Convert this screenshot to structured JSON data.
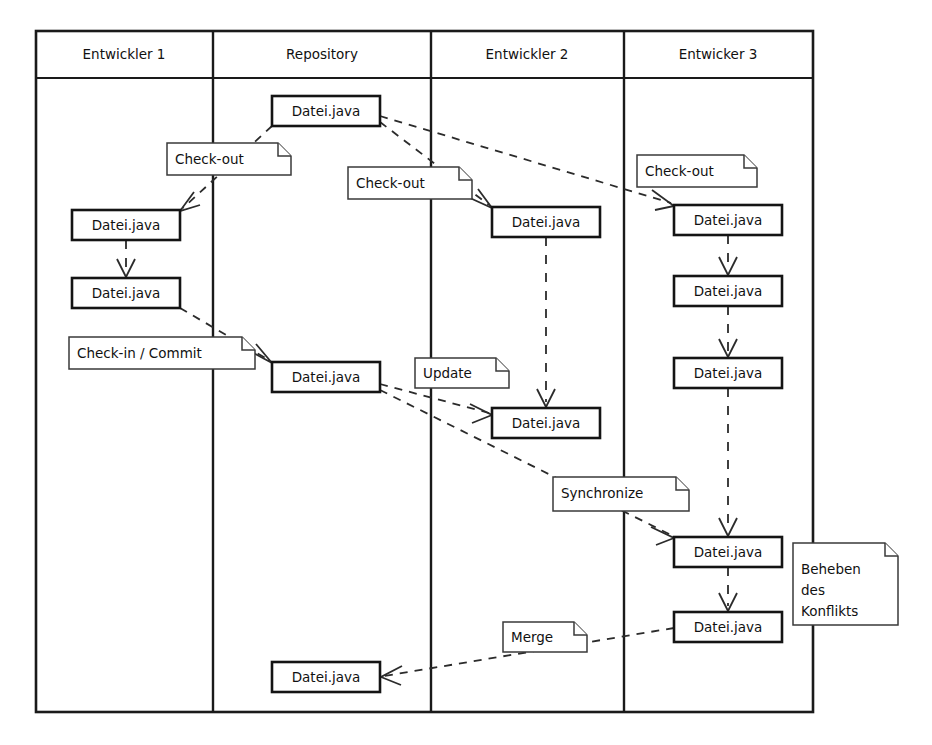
{
  "diagram": {
    "lanes": [
      {
        "id": "entwickler-1",
        "label": "Entwickler 1",
        "x": 36,
        "width": 177
      },
      {
        "id": "repository",
        "label": "Repository",
        "x": 213,
        "width": 218
      },
      {
        "id": "entwickler-2",
        "label": "Entwickler 2",
        "x": 431,
        "width": 193
      },
      {
        "id": "entwickler-3",
        "label": "Entwicker 3",
        "x": 624,
        "width": 189
      }
    ],
    "frame": {
      "x": 36,
      "y": 31,
      "width": 777,
      "height": 681,
      "header_height": 47
    },
    "colors": {
      "line": "#1a1a1a",
      "box_stroke": "#141414",
      "note_stroke": "#3a3a3a",
      "dash_stroke": "#2b2b2b",
      "background": "#ffffff"
    },
    "artifacts": [
      {
        "id": "repo-initial",
        "lane": "repository",
        "label": "Datei.java",
        "x": 272,
        "y": 96,
        "width": 108,
        "height": 30
      },
      {
        "id": "dev1-checkout",
        "lane": "entwickler-1",
        "label": "Datei.java",
        "x": 72,
        "y": 210,
        "width": 108,
        "height": 30
      },
      {
        "id": "dev1-edited",
        "lane": "entwickler-1",
        "label": "Datei.java",
        "x": 72,
        "y": 278,
        "width": 108,
        "height": 30
      },
      {
        "id": "dev2-checkout",
        "lane": "entwickler-2",
        "label": "Datei.java",
        "x": 492,
        "y": 207,
        "width": 108,
        "height": 30
      },
      {
        "id": "dev3-checkout",
        "lane": "entwickler-3",
        "label": "Datei.java",
        "x": 674,
        "y": 205,
        "width": 108,
        "height": 30
      },
      {
        "id": "repo-commit",
        "lane": "repository",
        "label": "Datei.java",
        "x": 272,
        "y": 362,
        "width": 108,
        "height": 30
      },
      {
        "id": "dev3-edit-1",
        "lane": "entwickler-3",
        "label": "Datei.java",
        "x": 674,
        "y": 276,
        "width": 108,
        "height": 30
      },
      {
        "id": "dev3-edit-2",
        "lane": "entwickler-3",
        "label": "Datei.java",
        "x": 674,
        "y": 358,
        "width": 108,
        "height": 30
      },
      {
        "id": "dev2-updated",
        "lane": "entwickler-2",
        "label": "Datei.java",
        "x": 492,
        "y": 408,
        "width": 108,
        "height": 30
      },
      {
        "id": "dev3-sync",
        "lane": "entwickler-3",
        "label": "Datei.java",
        "x": 674,
        "y": 537,
        "width": 108,
        "height": 30
      },
      {
        "id": "dev3-resolved",
        "lane": "entwickler-3",
        "label": "Datei.java",
        "x": 674,
        "y": 612,
        "width": 108,
        "height": 30
      },
      {
        "id": "repo-merged",
        "lane": "repository",
        "label": "Datei.java",
        "x": 272,
        "y": 662,
        "width": 108,
        "height": 30
      }
    ],
    "notes": [
      {
        "id": "note-checkout-dev1",
        "label": "Check-out",
        "lines": [
          "Check-out"
        ],
        "x": 167,
        "y": 143,
        "width": 124,
        "height": 32
      },
      {
        "id": "note-checkout-dev2",
        "label": "Check-out",
        "lines": [
          "Check-out"
        ],
        "x": 348,
        "y": 167,
        "width": 124,
        "height": 32
      },
      {
        "id": "note-checkout-dev3",
        "label": "Check-out",
        "lines": [
          "Check-out"
        ],
        "x": 637,
        "y": 155,
        "width": 120,
        "height": 32
      },
      {
        "id": "note-checkin-commit",
        "label": "Check-in / Commit",
        "lines": [
          "Check-in / Commit"
        ],
        "x": 69,
        "y": 337,
        "width": 186,
        "height": 32
      },
      {
        "id": "note-update",
        "label": "Update",
        "lines": [
          "Update"
        ],
        "x": 415,
        "y": 358,
        "width": 94,
        "height": 30
      },
      {
        "id": "note-synchronize",
        "label": "Synchronize",
        "lines": [
          "Synchronize"
        ],
        "x": 553,
        "y": 477,
        "width": 136,
        "height": 34
      },
      {
        "id": "note-merge",
        "label": "Merge",
        "lines": [
          "Merge"
        ],
        "x": 503,
        "y": 622,
        "width": 84,
        "height": 30
      },
      {
        "id": "note-beheben",
        "label": "Beheben des Konflikts",
        "lines": [
          "Beheben",
          "des",
          "Konflikts"
        ],
        "x": 793,
        "y": 543,
        "width": 105,
        "height": 82
      }
    ],
    "flows": [
      {
        "id": "flow-repo-to-dev1",
        "from": "repo-initial",
        "to": "dev1-checkout",
        "style": "dashed-arrow"
      },
      {
        "id": "flow-repo-to-dev2",
        "from": "repo-initial",
        "to": "dev2-checkout",
        "style": "dashed-arrow"
      },
      {
        "id": "flow-repo-to-dev3",
        "from": "repo-initial",
        "to": "dev3-checkout",
        "style": "dashed-arrow"
      },
      {
        "id": "flow-dev1-edit",
        "from": "dev1-checkout",
        "to": "dev1-edited",
        "style": "dashed-arrow-vertical"
      },
      {
        "id": "flow-dev1-commit",
        "from": "dev1-edited",
        "to": "repo-commit",
        "style": "dashed-arrow"
      },
      {
        "id": "flow-dev2-hold",
        "from": "dev2-checkout",
        "to": "dev2-updated",
        "style": "dashed-arrow-vertical"
      },
      {
        "id": "flow-repo-update-dev2",
        "from": "repo-commit",
        "to": "dev2-updated",
        "style": "dashed-arrow"
      },
      {
        "id": "flow-dev3-edit-1",
        "from": "dev3-checkout",
        "to": "dev3-edit-1",
        "style": "dashed-arrow-vertical"
      },
      {
        "id": "flow-dev3-edit-2",
        "from": "dev3-edit-1",
        "to": "dev3-edit-2",
        "style": "dashed-arrow-vertical"
      },
      {
        "id": "flow-dev3-to-sync",
        "from": "dev3-edit-2",
        "to": "dev3-sync",
        "style": "dashed-arrow-vertical"
      },
      {
        "id": "flow-repo-sync-dev3",
        "from": "repo-commit",
        "to": "dev3-sync",
        "style": "dashed-arrow"
      },
      {
        "id": "flow-dev3-resolve",
        "from": "dev3-sync",
        "to": "dev3-resolved",
        "style": "dashed-arrow-vertical"
      },
      {
        "id": "flow-dev3-merge-repo",
        "from": "dev3-resolved",
        "to": "repo-merged",
        "style": "dashed-arrow"
      }
    ]
  }
}
